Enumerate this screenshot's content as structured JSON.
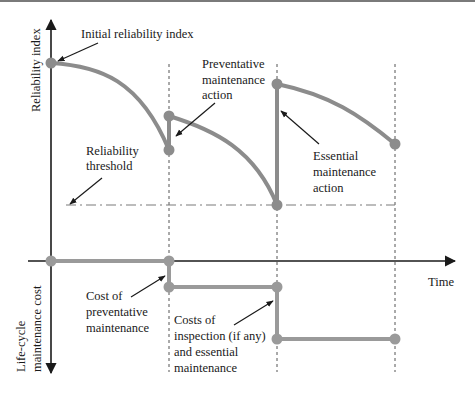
{
  "diagram": {
    "type": "reliability-vs-maintenance-cost",
    "colors": {
      "curve": "#8c8c8c",
      "axis": "#1a1a1a",
      "guides": "#555555",
      "threshold": "#7a7a7a",
      "text": "#1a1a1a"
    },
    "axes": {
      "y_upper_label": "Reliability index",
      "y_lower_label_line1": "Life-cycle",
      "y_lower_label_line2": "maintenance cost",
      "x_label": "Time"
    },
    "annotations": {
      "initial": "Initial reliability index",
      "preventative_line1": "Preventative",
      "preventative_line2": "maintenance",
      "preventative_line3": "action",
      "threshold_line1": "Reliability",
      "threshold_line2": "threshold",
      "essential_line1": "Essential",
      "essential_line2": "maintenance",
      "essential_line3": "action",
      "cost_prev_line1": "Cost of",
      "cost_prev_line2": "preventative",
      "cost_prev_line3": "maintenance",
      "cost_ess_line1": "Costs of",
      "cost_ess_line2": "inspection (if any)",
      "cost_ess_line3": "and essential",
      "cost_ess_line4": "maintenance"
    },
    "reliability_points": [
      {
        "x": 51,
        "y": 63,
        "name": "initial"
      },
      {
        "x": 169,
        "y": 150,
        "name": "before-preventative"
      },
      {
        "x": 169,
        "y": 116,
        "name": "after-preventative"
      },
      {
        "x": 277,
        "y": 205,
        "name": "before-essential"
      },
      {
        "x": 277,
        "y": 84,
        "name": "after-essential"
      },
      {
        "x": 395,
        "y": 144,
        "name": "end"
      }
    ],
    "cost_points": [
      {
        "x": 51,
        "y": 261
      },
      {
        "x": 169,
        "y": 261
      },
      {
        "x": 169,
        "y": 287
      },
      {
        "x": 277,
        "y": 287
      },
      {
        "x": 277,
        "y": 339
      },
      {
        "x": 395,
        "y": 339
      }
    ]
  }
}
